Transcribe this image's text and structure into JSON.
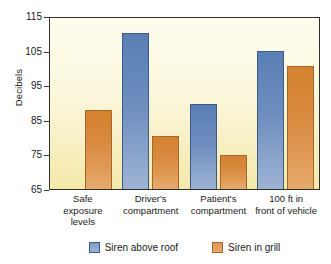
{
  "chart_data": {
    "type": "bar",
    "title": "",
    "xlabel": "",
    "ylabel": "Decibels",
    "ylim": [
      65,
      115
    ],
    "yticks": [
      115,
      105,
      95,
      85,
      75,
      65
    ],
    "grid": false,
    "legend_position": "bottom",
    "categories": [
      "Safe\nexposure\nlevels",
      "Driver's\ncompartment",
      "Patient's\ncompartment",
      "100 ft in\nfront of vehicle"
    ],
    "category_labels": [
      [
        "Safe",
        "exposure",
        "levels"
      ],
      [
        "Driver's",
        "compartment"
      ],
      [
        "Patient's",
        "compartment"
      ],
      [
        "100 ft in",
        "front of vehicle"
      ]
    ],
    "series": [
      {
        "name": "Siren above roof",
        "color": "#6d8dbe",
        "values": [
          null,
          110.5,
          90,
          105.5
        ]
      },
      {
        "name": "Siren in grill",
        "color": "#d98a3f",
        "values": [
          88,
          80.5,
          75,
          101
        ]
      }
    ]
  },
  "axis": {
    "y_title": "Decibels",
    "y_tick_labels": [
      "115",
      "105",
      "95",
      "85",
      "75",
      "65"
    ]
  },
  "x_labels": [
    {
      "line1": "Safe",
      "line2": "exposure",
      "line3": "levels"
    },
    {
      "line1": "Driver's",
      "line2": "compartment",
      "line3": ""
    },
    {
      "line1": "Patient's",
      "line2": "compartment",
      "line3": ""
    },
    {
      "line1": "100 ft in",
      "line2": "front of vehicle",
      "line3": ""
    }
  ],
  "legend": {
    "entries": [
      {
        "label": "Siren above roof",
        "color": "#6d8dbe"
      },
      {
        "label": "Siren in grill",
        "color": "#d98a3f"
      }
    ]
  },
  "colors": {
    "series_blue": "#6d8dbe",
    "series_orange": "#d98a3f",
    "plot_background_top": "#fdfbec",
    "plot_background_bottom": "#f4e9aa",
    "axis_line": "#2e2e2e",
    "text": "#1a1a1a"
  }
}
